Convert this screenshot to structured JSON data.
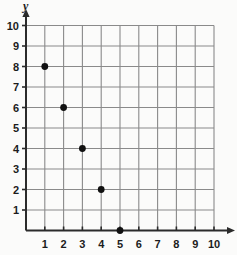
{
  "chart_data": {
    "type": "scatter",
    "title": "",
    "xlabel": "x",
    "ylabel": "y",
    "xlim": [
      0,
      10
    ],
    "ylim": [
      0,
      10
    ],
    "grid": true,
    "legend": null,
    "xticks": [
      "1",
      "2",
      "3",
      "4",
      "5",
      "6",
      "7",
      "8",
      "9",
      "10"
    ],
    "yticks": [
      "1",
      "2",
      "3",
      "4",
      "5",
      "6",
      "7",
      "8",
      "9",
      "10"
    ],
    "xtick_values": [
      1,
      2,
      3,
      4,
      5,
      6,
      7,
      8,
      9,
      10
    ],
    "ytick_values": [
      1,
      2,
      3,
      4,
      5,
      6,
      7,
      8,
      9,
      10
    ],
    "series": [
      {
        "name": "points",
        "marker": "filled-circle",
        "color": "#111111",
        "points": [
          {
            "x": 1,
            "y": 8
          },
          {
            "x": 2,
            "y": 6
          },
          {
            "x": 3,
            "y": 4
          },
          {
            "x": 4,
            "y": 2
          },
          {
            "x": 5,
            "y": 0
          }
        ]
      }
    ]
  },
  "axes": {
    "y_axis_label": "y",
    "x_axis_label": "",
    "axis_color": "#2b2b2b",
    "grid_color": "#8a8a8a",
    "background": "#fbfbfa"
  }
}
